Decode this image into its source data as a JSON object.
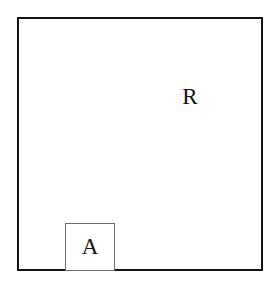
{
  "figure": {
    "background_color": "#ffffff",
    "width": 277,
    "height": 285,
    "outer_region": {
      "label": "R",
      "border_color": "#151515",
      "border_width_px": 2.5,
      "fill_color": "#ffffff",
      "x": 17,
      "y": 17,
      "width": 246,
      "height": 254
    },
    "inner_region": {
      "label": "A",
      "border_color": "#6b6b6b",
      "border_width_px": 1.2,
      "fill_color": "#ffffff",
      "x": 46,
      "y": 204,
      "width": 50,
      "height": 48
    }
  }
}
